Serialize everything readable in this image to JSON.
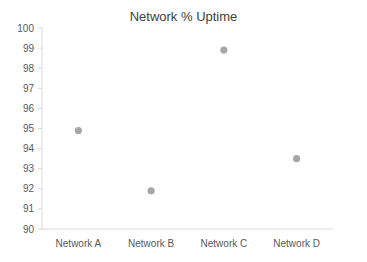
{
  "chart_data": {
    "type": "scatter",
    "title": "Network % Uptime",
    "xlabel": "",
    "ylabel": "",
    "categories": [
      "Network A",
      "Network B",
      "Network C",
      "Network D"
    ],
    "values": [
      94.9,
      91.9,
      98.9,
      93.5
    ],
    "ylim": [
      90,
      100
    ],
    "yticks": [
      "100",
      "99",
      "98",
      "97",
      "96",
      "95",
      "94",
      "93",
      "92",
      "91",
      "90"
    ],
    "grid": false,
    "legend": null,
    "marker_color": "#a6a6a6",
    "axis_color": "#d9d9d9"
  }
}
